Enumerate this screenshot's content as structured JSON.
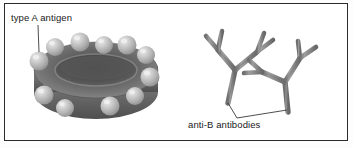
{
  "figure": {
    "background_color": "#ffffff",
    "border_color": "#2b2b2b"
  },
  "labels": {
    "antigen": "type A antigen",
    "antibody": "anti-B antibodies"
  },
  "colors": {
    "cell_body": "#6e6e6e",
    "cell_dark": "#4a4a4a",
    "cell_light": "#8f8f8f",
    "antigen_sphere": "#b9b9b9",
    "antigen_highlight": "#e3e3e3",
    "antibody": "#8a8a8a",
    "antibody_edge": "#6a6a6a",
    "leader_line": "#3a3a3a",
    "text": "#1a1a1a"
  },
  "diagram": {
    "type": "biology-illustration",
    "elements": [
      {
        "name": "red-blood-cell",
        "description": "biconcave disc viewed obliquely, shaded gray, with central depression",
        "antigen_count": 11
      },
      {
        "name": "anti-b-antibodies",
        "description": "two Y-shaped antibody molecules with forked arms",
        "count": 2
      }
    ]
  }
}
